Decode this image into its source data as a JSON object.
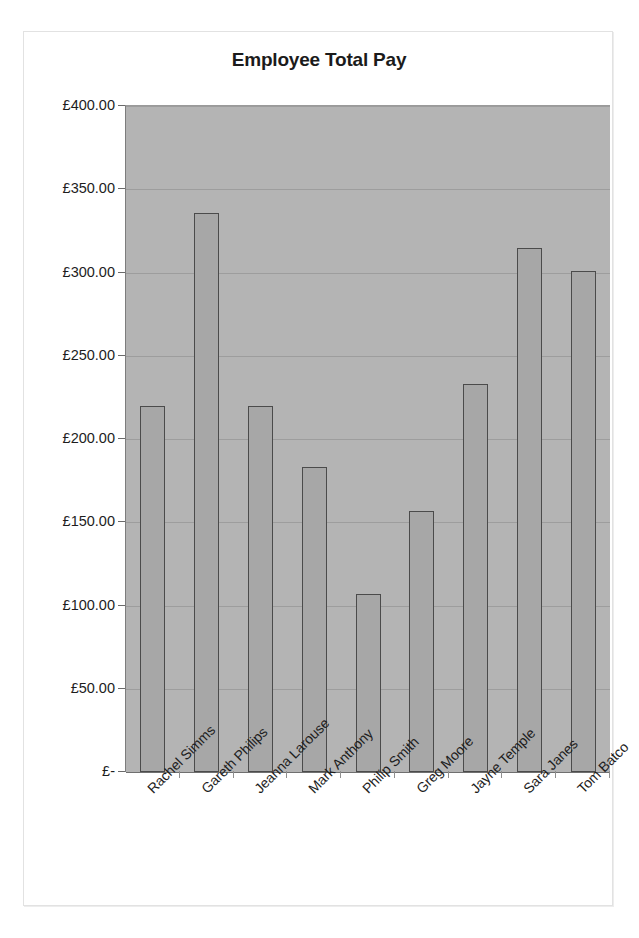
{
  "chart_data": {
    "type": "bar",
    "title": "Employee Total Pay",
    "xlabel": "",
    "ylabel": "",
    "currency_symbol": "£",
    "categories": [
      "Rachel Simms",
      "Gareth Philips",
      "Jeanna Larouse",
      "Mark Anthony",
      "Philip Smith",
      "Greg Moore",
      "Jayne Temple",
      "Sara Janes",
      "Tom Batco"
    ],
    "values": [
      220,
      336,
      220,
      183,
      107,
      157,
      233,
      315,
      301
    ],
    "ylim": [
      0,
      400
    ],
    "ytick_values": [
      0,
      50,
      100,
      150,
      200,
      250,
      300,
      350,
      400
    ],
    "ytick_labels": [
      "£-",
      "£50.00",
      "£100.00",
      "£150.00",
      "£200.00",
      "£250.00",
      "£300.00",
      "£350.00",
      "£400.00"
    ],
    "grid": true,
    "legend": false,
    "legend_position": "none",
    "plot_background_color": "#b4b4b4",
    "bar_fill_color": "#a7a7a7",
    "bar_border_color": "#4b4b4b",
    "gridline_color": "#9d9d9d",
    "text_color": "#1d1d1d",
    "xtick_label_rotation": -45
  }
}
